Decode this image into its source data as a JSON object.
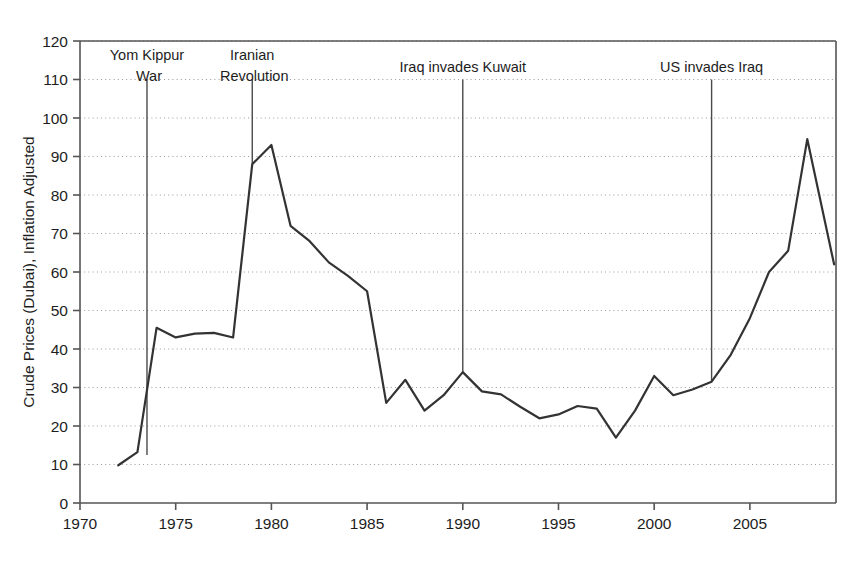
{
  "chart_data": {
    "type": "line",
    "title": "",
    "xlabel": "",
    "ylabel": "Crude Prices (Dubai), Inflation Adjusted",
    "xlim": [
      1970,
      2009.5
    ],
    "ylim": [
      0,
      120
    ],
    "ytick_step": 10,
    "xtick_step": 5,
    "grid": "horizontal-dotted",
    "legend": "none",
    "line_color": "#333333",
    "axis_color": "#555555",
    "grid_color": "#9a9a9a",
    "xticks": [
      1970,
      1975,
      1980,
      1985,
      1990,
      1995,
      2000,
      2005
    ],
    "xtick_labels": [
      "1970",
      "1975",
      "1980",
      "1985",
      "1990",
      "1995",
      "2000",
      "2005"
    ],
    "yticks": [
      0,
      10,
      20,
      30,
      40,
      50,
      60,
      70,
      80,
      90,
      100,
      110,
      120
    ],
    "ytick_labels": [
      "0",
      "10",
      "20",
      "30",
      "40",
      "50",
      "60",
      "70",
      "80",
      "90",
      "100",
      "110",
      "120"
    ],
    "x": [
      1972,
      1973,
      1974,
      1975,
      1976,
      1977,
      1978,
      1979,
      1980,
      1981,
      1982,
      1983,
      1984,
      1985,
      1986,
      1987,
      1988,
      1989,
      1990,
      1991,
      1992,
      1993,
      1994,
      1995,
      1996,
      1997,
      1998,
      1999,
      2000,
      2001,
      2002,
      2003,
      2004,
      2005,
      2006,
      2007,
      2008,
      2009.4
    ],
    "values": [
      9.8,
      13.2,
      45.5,
      43.0,
      44.0,
      44.2,
      43.0,
      88.0,
      93.0,
      72.0,
      68.0,
      62.5,
      59.0,
      55.0,
      26.0,
      32.0,
      24.0,
      28.0,
      34.0,
      29.0,
      28.2,
      25.0,
      22.0,
      23.0,
      25.2,
      24.5,
      17.0,
      24.0,
      33.0,
      28.0,
      29.5,
      31.5,
      38.5,
      48.0,
      60.0,
      65.5,
      94.5,
      62.0
    ],
    "annotations": [
      {
        "label_line1": "Yom Kippur",
        "label_line2": "War",
        "x": 1973.5,
        "line_top": 110,
        "line_bottom": 12.5
      },
      {
        "label_line1": "Iranian",
        "label_line2": "Revolution",
        "x": 1979,
        "line_top": 110,
        "line_bottom": 88.0
      },
      {
        "label_line1": "Iraq invades Kuwait",
        "label_line2": "",
        "x": 1990,
        "line_top": 110,
        "line_bottom": 34.0
      },
      {
        "label_line1": "US invades Iraq",
        "label_line2": "",
        "x": 2003,
        "line_top": 110,
        "line_bottom": 31.5
      }
    ]
  }
}
